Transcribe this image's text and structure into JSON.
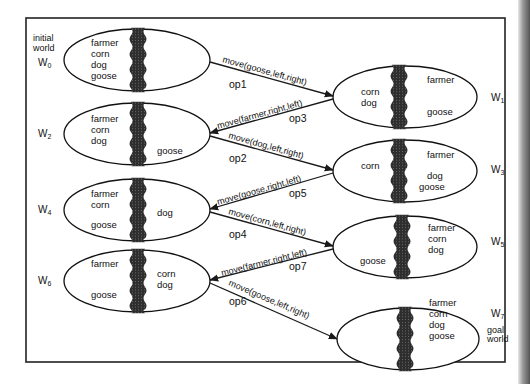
{
  "diagram": {
    "river_color": "#3a3a3a",
    "line_color": "#1a1a1a",
    "worlds": [
      {
        "id": "W0",
        "name": "W",
        "sub": "0",
        "side_note": [
          "initial",
          "world"
        ],
        "left_bank": [
          "farmer",
          "corn",
          "dog",
          "goose"
        ],
        "right_bank": []
      },
      {
        "id": "W1",
        "name": "W",
        "sub": "1",
        "side_note": [],
        "left_bank": [
          "corn",
          "dog"
        ],
        "right_bank": [
          "farmer",
          "goose"
        ]
      },
      {
        "id": "W2",
        "name": "W",
        "sub": "2",
        "side_note": [],
        "left_bank": [
          "farmer",
          "corn",
          "dog"
        ],
        "right_bank": [
          "goose"
        ]
      },
      {
        "id": "W3",
        "name": "W",
        "sub": "3",
        "side_note": [],
        "left_bank": [
          "corn"
        ],
        "right_bank": [
          "farmer",
          "dog",
          "goose"
        ]
      },
      {
        "id": "W4",
        "name": "W",
        "sub": "4",
        "side_note": [],
        "left_bank": [
          "farmer",
          "corn",
          "goose"
        ],
        "right_bank": [
          "dog"
        ]
      },
      {
        "id": "W5",
        "name": "W",
        "sub": "5",
        "side_note": [],
        "left_bank": [
          "goose"
        ],
        "right_bank": [
          "farmer",
          "corn",
          "dog"
        ]
      },
      {
        "id": "W6",
        "name": "W",
        "sub": "6",
        "side_note": [],
        "left_bank": [
          "farmer",
          "goose"
        ],
        "right_bank": [
          "corn",
          "dog"
        ]
      },
      {
        "id": "W7",
        "name": "W",
        "sub": "7",
        "side_note": [
          "goal",
          "world"
        ],
        "left_bank": [],
        "right_bank": [
          "farmer",
          "corn",
          "dog",
          "goose"
        ]
      }
    ],
    "operators": [
      {
        "id": "op1",
        "label": "move(goose,left,right)",
        "from": "W0",
        "to": "W1"
      },
      {
        "id": "op3",
        "label": "move(farmer,right,left)",
        "from": "W1",
        "to": "W2"
      },
      {
        "id": "op2",
        "label": "move(dog,left,right)",
        "from": "W2",
        "to": "W3"
      },
      {
        "id": "op5",
        "label": "move(goose,right,left)",
        "from": "W3",
        "to": "W4"
      },
      {
        "id": "op4",
        "label": "move(corn,left,right)",
        "from": "W4",
        "to": "W5"
      },
      {
        "id": "op7",
        "label": "move(farmer,right,left)",
        "from": "W5",
        "to": "W6"
      },
      {
        "id": "op6",
        "label": "move(goose,left,right)",
        "from": "W6",
        "to": "W7"
      }
    ]
  }
}
